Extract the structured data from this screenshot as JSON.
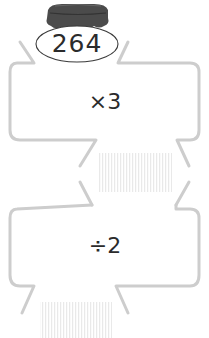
{
  "jar": {
    "value": "264",
    "icon": "jar-icon",
    "lid_color": "#4a4a4a"
  },
  "machines": [
    {
      "operation": "×3",
      "answer_box": "blank-answer-area"
    },
    {
      "operation": "÷2",
      "answer_box": "blank-answer-area"
    }
  ],
  "colors": {
    "outline": "#cdcdcd",
    "text": "#2b2b2b",
    "hatch": "#ececec"
  }
}
